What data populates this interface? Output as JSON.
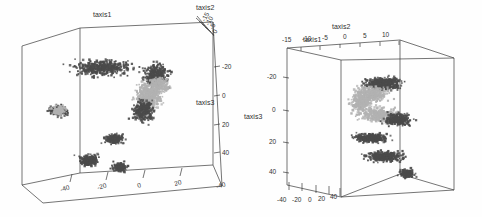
{
  "figure": {
    "kind": "two-panel-3d-scatter",
    "background_color": "#fefefe",
    "line_color": "#3a3a3a",
    "point_colors": {
      "dark": "#4b4b4b",
      "light": "#b2b2b2"
    }
  },
  "chart_data": [
    {
      "type": "scatter",
      "panel": "left",
      "title": "",
      "projection": "3d",
      "grid": false,
      "legend": null,
      "axes": {
        "taxis1": {
          "label": "taxis1",
          "position": "top-left",
          "ticks": [],
          "ticklabels": []
        },
        "taxis2": {
          "label": "taxis2",
          "position": "top-right",
          "ticks": [
            -15,
            -10,
            -5,
            0
          ],
          "ticklabels": [
            "-15",
            "-10",
            "-5",
            "0"
          ]
        },
        "taxis3": {
          "label": "taxis3",
          "position": "right",
          "ticks": [
            -20,
            0,
            20,
            40
          ],
          "ticklabels": [
            "-20",
            "0",
            "20",
            "40"
          ]
        },
        "bottom": {
          "label": "",
          "position": "bottom",
          "ticks": [
            -40,
            -20,
            0,
            20
          ],
          "ticklabels": [
            "-40",
            "-20",
            "0",
            "20"
          ]
        },
        "bottom_right_corner": {
          "ticklabels": [
            "-40"
          ]
        }
      },
      "series": [
        {
          "name": "cluster-dark",
          "color": "#4b4b4b",
          "n_points": 1400
        },
        {
          "name": "cluster-light",
          "color": "#b2b2b2",
          "n_points": 900
        }
      ],
      "clusters": [
        {
          "series": "dark",
          "cx": 0.4,
          "cy": 0.26,
          "rx": 0.26,
          "ry": 0.09,
          "n": 420
        },
        {
          "series": "dark",
          "cx": 0.7,
          "cy": 0.3,
          "rx": 0.13,
          "ry": 0.12,
          "n": 300
        },
        {
          "series": "light",
          "cx": 0.66,
          "cy": 0.43,
          "rx": 0.13,
          "ry": 0.15,
          "n": 430
        },
        {
          "series": "dark",
          "cx": 0.63,
          "cy": 0.52,
          "rx": 0.11,
          "ry": 0.12,
          "n": 260
        },
        {
          "series": "dark",
          "cx": 0.16,
          "cy": 0.52,
          "rx": 0.09,
          "ry": 0.06,
          "n": 180
        },
        {
          "series": "light",
          "cx": 0.16,
          "cy": 0.52,
          "rx": 0.07,
          "ry": 0.05,
          "n": 110
        },
        {
          "series": "dark",
          "cx": 0.47,
          "cy": 0.69,
          "rx": 0.09,
          "ry": 0.05,
          "n": 190
        },
        {
          "series": "dark",
          "cx": 0.33,
          "cy": 0.82,
          "rx": 0.1,
          "ry": 0.06,
          "n": 230
        },
        {
          "series": "dark",
          "cx": 0.5,
          "cy": 0.86,
          "rx": 0.07,
          "ry": 0.05,
          "n": 150
        },
        {
          "series": "light",
          "cx": 0.72,
          "cy": 0.36,
          "rx": 0.09,
          "ry": 0.08,
          "n": 160
        }
      ]
    },
    {
      "type": "scatter",
      "panel": "right",
      "title": "",
      "projection": "3d",
      "grid": false,
      "legend": null,
      "axes": {
        "taxis1": {
          "label": "taxis1",
          "position": "top-left",
          "ticks": [],
          "ticklabels": []
        },
        "taxis2": {
          "label": "taxis2",
          "position": "top",
          "ticks": [
            -15,
            -10,
            -5,
            0,
            5,
            10
          ],
          "ticklabels": [
            "-15",
            "-10",
            "-5",
            "0",
            "5",
            "10"
          ]
        },
        "taxis3": {
          "label": "taxis3",
          "position": "left",
          "ticks": [
            -20,
            0,
            20,
            40
          ],
          "ticklabels": [
            "-20",
            "0",
            "20",
            "40"
          ]
        },
        "bottom": {
          "label": "",
          "position": "bottom-left",
          "ticks": [
            -40,
            -20,
            0,
            20,
            40
          ],
          "ticklabels": [
            "-40",
            "-20",
            "0",
            "20",
            "40"
          ]
        }
      },
      "series": [
        {
          "name": "cluster-dark",
          "color": "#4b4b4b",
          "n_points": 1500
        },
        {
          "name": "cluster-light",
          "color": "#b2b2b2",
          "n_points": 1000
        }
      ],
      "clusters": [
        {
          "series": "dark",
          "cx": 0.58,
          "cy": 0.27,
          "rx": 0.19,
          "ry": 0.07,
          "n": 430
        },
        {
          "series": "light",
          "cx": 0.5,
          "cy": 0.34,
          "rx": 0.2,
          "ry": 0.09,
          "n": 380
        },
        {
          "series": "light",
          "cx": 0.55,
          "cy": 0.47,
          "rx": 0.2,
          "ry": 0.09,
          "n": 330
        },
        {
          "series": "dark",
          "cx": 0.66,
          "cy": 0.5,
          "rx": 0.14,
          "ry": 0.07,
          "n": 260
        },
        {
          "series": "dark",
          "cx": 0.5,
          "cy": 0.62,
          "rx": 0.18,
          "ry": 0.05,
          "n": 300
        },
        {
          "series": "dark",
          "cx": 0.58,
          "cy": 0.74,
          "rx": 0.2,
          "ry": 0.06,
          "n": 330
        },
        {
          "series": "light",
          "cx": 0.44,
          "cy": 0.4,
          "rx": 0.1,
          "ry": 0.1,
          "n": 200
        },
        {
          "series": "dark",
          "cx": 0.72,
          "cy": 0.85,
          "rx": 0.08,
          "ry": 0.05,
          "n": 140
        }
      ]
    }
  ],
  "panel_left": {
    "name": "left-3d-scatter",
    "labels": {
      "taxis1": "taxis1",
      "taxis2": "taxis2",
      "taxis3": "taxis3"
    },
    "ticks": {
      "taxis2": [
        "-15",
        "-10",
        "-5",
        "0"
      ],
      "taxis3": [
        "-20",
        "0",
        "20",
        "40"
      ],
      "bottom": [
        "-40",
        "-20",
        "0",
        "20"
      ],
      "corner": "-40"
    }
  },
  "panel_right": {
    "name": "right-3d-scatter",
    "labels": {
      "taxis1": "taxis1",
      "taxis2": "taxis2",
      "taxis3": "taxis3"
    },
    "ticks": {
      "taxis2": [
        "-15",
        "-10",
        "-5",
        "0",
        "5",
        "10"
      ],
      "taxis3": [
        "-20",
        "0",
        "20",
        "40"
      ],
      "bottom": [
        "-40",
        "-20",
        "0",
        "20",
        "40"
      ]
    }
  }
}
